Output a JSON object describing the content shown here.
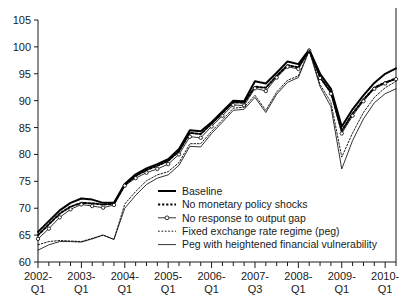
{
  "chart_data": {
    "type": "line",
    "title": "",
    "subtitle": "",
    "xlabel": "",
    "ylabel": "",
    "ylim": [
      60,
      105
    ],
    "yticks": [
      60,
      65,
      70,
      75,
      80,
      85,
      90,
      95,
      100,
      105
    ],
    "grid": false,
    "legend_position": "inside-lower-right",
    "x_tick_labels": [
      {
        "line1": "2002-",
        "line2": "Q1"
      },
      {
        "line1": "2003-",
        "line2": "Q1"
      },
      {
        "line1": "2004-",
        "line2": "Q1"
      },
      {
        "line1": "2005-",
        "line2": "Q1"
      },
      {
        "line1": "2006-",
        "line2": "Q1"
      },
      {
        "line1": "2007-",
        "line2": "Q3"
      },
      {
        "line1": "2008-",
        "line2": "Q1"
      },
      {
        "line1": "2009-",
        "line2": "Q1"
      },
      {
        "line1": "2010-",
        "line2": "Q1"
      }
    ],
    "x": [
      "2002-Q1",
      "2002-Q2",
      "2002-Q3",
      "2002-Q4",
      "2003-Q1",
      "2003-Q2",
      "2003-Q3",
      "2003-Q4",
      "2004-Q1",
      "2004-Q2",
      "2004-Q3",
      "2004-Q4",
      "2005-Q1",
      "2005-Q2",
      "2005-Q3",
      "2005-Q4",
      "2006-Q1",
      "2006-Q2",
      "2006-Q3",
      "2006-Q4",
      "2007-Q1",
      "2007-Q2",
      "2007-Q3",
      "2007-Q4",
      "2008-Q1",
      "2008-Q2",
      "2008-Q3",
      "2008-Q4",
      "2009-Q1",
      "2009-Q2",
      "2009-Q3",
      "2009-Q4",
      "2010-Q1",
      "2010-Q2"
    ],
    "series": [
      {
        "name": "Baseline",
        "style": "solid-thick",
        "marker": "none",
        "color": "#000000",
        "values": [
          65.6,
          67.6,
          69.6,
          71.0,
          71.8,
          71.6,
          71.0,
          71.0,
          74.5,
          76.3,
          77.4,
          78.2,
          79.1,
          81.0,
          84.5,
          84.3,
          86.0,
          88.0,
          90.0,
          89.9,
          93.6,
          93.2,
          95.2,
          97.3,
          96.8,
          99.5,
          95.0,
          92.2,
          85.2,
          88.4,
          91.0,
          93.3,
          95.0,
          96.0
        ]
      },
      {
        "name": "No monetary policy shocks",
        "style": "dotted-thick",
        "marker": "none",
        "color": "#000000",
        "values": [
          65.0,
          67.0,
          69.0,
          70.3,
          71.0,
          70.9,
          70.7,
          70.8,
          74.3,
          76.0,
          77.1,
          77.9,
          78.8,
          80.6,
          84.0,
          83.8,
          85.7,
          87.7,
          89.7,
          89.6,
          92.6,
          92.4,
          94.6,
          96.6,
          96.2,
          99.4,
          94.4,
          91.6,
          84.4,
          87.6,
          90.2,
          92.4,
          93.4,
          94.1
        ]
      },
      {
        "name": "No response to output gap",
        "style": "solid-thin",
        "marker": "circle",
        "color": "#000000",
        "values": [
          64.3,
          66.2,
          68.3,
          69.8,
          70.7,
          70.4,
          70.1,
          70.6,
          74.2,
          75.6,
          76.6,
          77.3,
          78.2,
          80.0,
          83.3,
          83.1,
          85.2,
          87.2,
          89.2,
          89.1,
          92.3,
          91.8,
          94.3,
          96.3,
          95.9,
          99.3,
          94.2,
          91.3,
          83.9,
          87.2,
          89.9,
          92.2,
          93.2,
          94.0
        ]
      },
      {
        "name": "Fixed exchange rate regime (peg)",
        "style": "dotted-thin",
        "marker": "none",
        "color": "#000000",
        "values": [
          63.2,
          63.8,
          64.0,
          63.9,
          63.8,
          64.4,
          65.0,
          64.2,
          70.8,
          73.1,
          75.1,
          76.2,
          76.8,
          78.5,
          82.0,
          82.0,
          84.3,
          86.4,
          88.6,
          88.8,
          91.0,
          88.2,
          91.6,
          93.8,
          94.6,
          99.4,
          93.0,
          89.7,
          79.5,
          84.0,
          87.8,
          90.6,
          92.4,
          93.6
        ]
      },
      {
        "name": "Peg with heightened financial vulnerability",
        "style": "solid-thin",
        "marker": "none",
        "color": "#000000",
        "values": [
          62.2,
          63.2,
          63.8,
          63.8,
          63.7,
          64.3,
          65.0,
          64.2,
          70.0,
          72.4,
          74.4,
          75.6,
          76.2,
          78.0,
          81.5,
          81.4,
          83.9,
          86.0,
          88.2,
          88.4,
          90.6,
          87.8,
          91.2,
          93.4,
          94.3,
          99.3,
          92.6,
          88.9,
          77.3,
          82.6,
          86.6,
          89.6,
          91.3,
          92.2
        ]
      }
    ],
    "legend_entries": [
      {
        "label": "Baseline",
        "style": "solid-thick",
        "marker": "none"
      },
      {
        "label": "No monetary policy shocks",
        "style": "dotted-thick",
        "marker": "none"
      },
      {
        "label": "No response to output gap",
        "style": "solid-thin",
        "marker": "circle"
      },
      {
        "label": "Fixed exchange rate regime (peg)",
        "style": "dotted-thin",
        "marker": "none"
      },
      {
        "label": "Peg with heightened financial vulnerability",
        "style": "solid-thin",
        "marker": "none"
      }
    ]
  }
}
